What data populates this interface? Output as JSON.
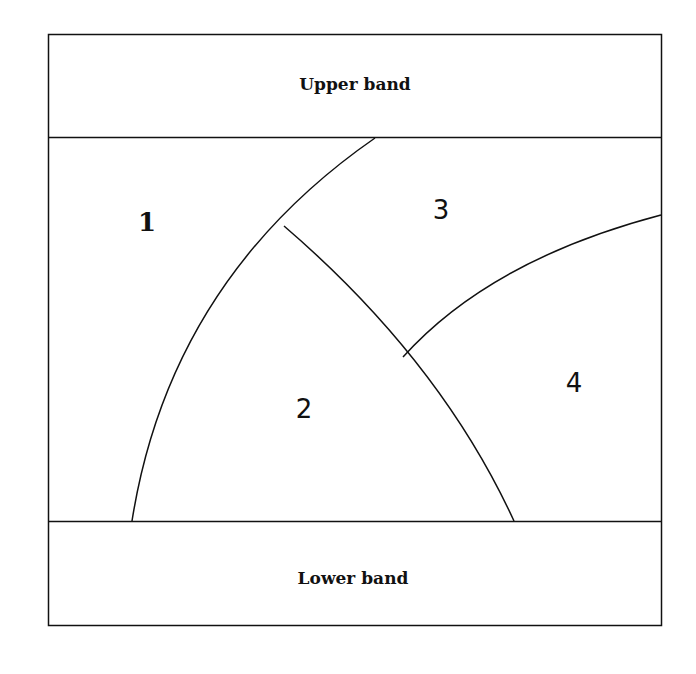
{
  "diagram": {
    "type": "region-partition",
    "bands": {
      "upper": "Upper band",
      "lower": "Lower band"
    },
    "regions": [
      {
        "id": "1",
        "label": "1"
      },
      {
        "id": "2",
        "label": "2"
      },
      {
        "id": "3",
        "label": "3"
      },
      {
        "id": "4",
        "label": "4"
      }
    ],
    "colors": {
      "stroke": "#111111",
      "background": "#ffffff"
    }
  }
}
